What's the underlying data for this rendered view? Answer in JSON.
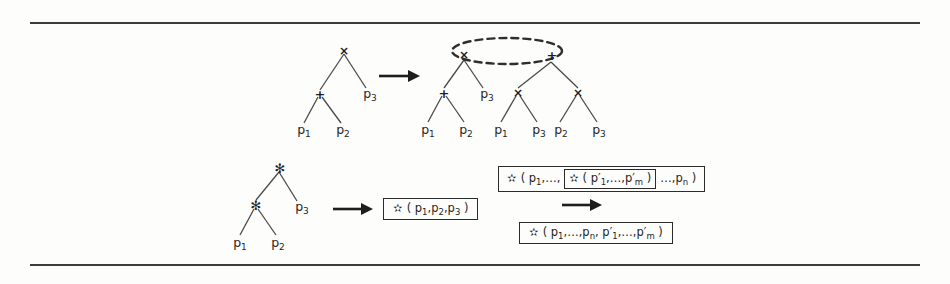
{
  "figure": {
    "background_color": "#fdfdfc",
    "ink_color": "#2b2b2b",
    "rules": {
      "top_label": "horizontal-rule-top",
      "bottom_label": "horizontal-rule-bottom"
    },
    "symbols": {
      "times": "×",
      "plus": "+",
      "star": "✻",
      "arrow": "→",
      "ellipsis": "…",
      "comma": ","
    },
    "top_transformation": {
      "name": "distribution-rule",
      "source_tree": {
        "root": {
          "symbol": "×",
          "name": "times-node"
        },
        "nodes": [
          {
            "symbol": "+",
            "name": "plus-node"
          }
        ],
        "leaves": [
          {
            "label": "p",
            "sub": "1"
          },
          {
            "label": "p",
            "sub": "2"
          },
          {
            "label": "p",
            "sub": "3"
          }
        ]
      },
      "result_tree": {
        "root": {
          "symbol": "+",
          "name": "plus-node"
        },
        "selected_nodes": [
          {
            "symbol": "×",
            "name": "times-node-left"
          },
          {
            "symbol": "+",
            "name": "plus-node-right"
          }
        ],
        "inner_nodes": [
          {
            "symbol": "+",
            "name": "plus-node"
          },
          {
            "symbol": "×",
            "name": "times-node-mid"
          },
          {
            "symbol": "×",
            "name": "times-node-right"
          }
        ],
        "leaves": [
          {
            "label": "p",
            "sub": "1"
          },
          {
            "label": "p",
            "sub": "2"
          },
          {
            "label": "p",
            "sub": "3"
          },
          {
            "label": "p",
            "sub": "1"
          },
          {
            "label": "p",
            "sub": "3"
          },
          {
            "label": "p",
            "sub": "2"
          },
          {
            "label": "p",
            "sub": "3"
          }
        ],
        "selection_marker": "dashed-ellipse"
      }
    },
    "bottom_left_transformation": {
      "name": "flatten-tree-rule",
      "source_tree": {
        "root": {
          "symbol": "✻",
          "name": "star-node-root"
        },
        "nodes": [
          {
            "symbol": "✻",
            "name": "star-node-child"
          }
        ],
        "leaves": [
          {
            "label": "p",
            "sub": "1"
          },
          {
            "label": "p",
            "sub": "2"
          },
          {
            "label": "p",
            "sub": "3"
          }
        ]
      },
      "result_expression": {
        "name": "flattened-expression-box",
        "parts": [
          {
            "type": "op",
            "text": "✻"
          },
          {
            "type": "text",
            "text": "( p"
          },
          {
            "type": "sub",
            "text": "1"
          },
          {
            "type": "text",
            "text": ",p"
          },
          {
            "type": "sub",
            "text": "2"
          },
          {
            "type": "text",
            "text": ",p"
          },
          {
            "type": "sub",
            "text": "3"
          },
          {
            "type": "text",
            "text": " )"
          }
        ],
        "plain": "✻( p1,p2,p3 )"
      }
    },
    "bottom_right_transformation": {
      "name": "nested-flatten-rule",
      "source_expression": {
        "name": "nested-expression-box",
        "outer_prefix": "✻( p",
        "outer_prefix_sub": "1",
        "outer_prefix_tail": ",…,",
        "inner_box": {
          "name": "inner-expression-box",
          "op": "✻",
          "text": "( p′",
          "sub1": "1",
          "mid": ",…,p′",
          "sub2": "m",
          "close": " )"
        },
        "outer_suffix": "…,p",
        "outer_suffix_sub": "n",
        "outer_close": " )",
        "plain": "✻( p1,…, ✻( p′1,…,p′m ) …,pn )"
      },
      "result_expression": {
        "name": "merged-expression-box",
        "op": "✻",
        "seg1": "( p",
        "sub1": "1",
        "seg2": ",…,p",
        "sub2": "n",
        "seg3": ", p′",
        "sub3": "1",
        "seg4": ",…,p′",
        "sub4": "m",
        "close": " )",
        "plain": "✻( p1,…,pn, p′1,…,p′m )"
      }
    }
  }
}
